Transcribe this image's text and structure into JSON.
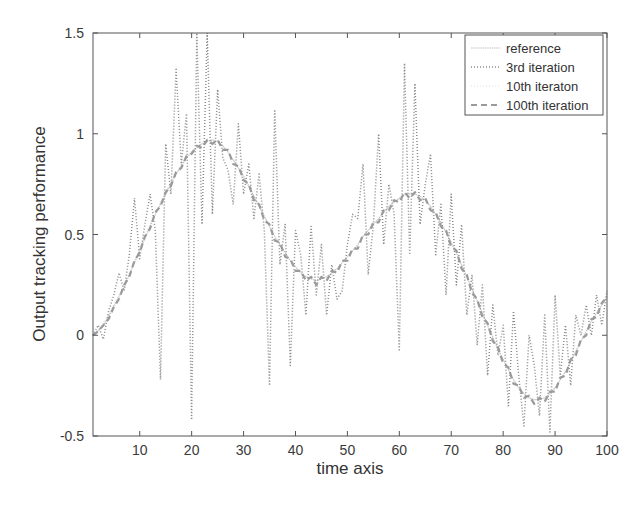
{
  "chart_data": {
    "type": "line",
    "title": "",
    "xlabel": "time axis",
    "ylabel": "Output tracking performance",
    "xlim": [
      1,
      100
    ],
    "ylim": [
      -0.5,
      1.5
    ],
    "xticks": [
      10,
      20,
      30,
      40,
      50,
      60,
      70,
      80,
      90,
      100
    ],
    "yticks": [
      -0.5,
      0,
      0.5,
      1,
      1.5
    ],
    "ytick_labels": [
      "-0.5",
      "0",
      "0.5",
      "1",
      "1.5"
    ],
    "grid": false,
    "legend_position": "upper right",
    "x": [
      1,
      2,
      3,
      4,
      5,
      6,
      7,
      8,
      9,
      10,
      11,
      12,
      13,
      14,
      15,
      16,
      17,
      18,
      19,
      20,
      21,
      22,
      23,
      24,
      25,
      26,
      27,
      28,
      29,
      30,
      31,
      32,
      33,
      34,
      35,
      36,
      37,
      38,
      39,
      40,
      41,
      42,
      43,
      44,
      45,
      46,
      47,
      48,
      49,
      50,
      51,
      52,
      53,
      54,
      55,
      56,
      57,
      58,
      59,
      60,
      61,
      62,
      63,
      64,
      65,
      66,
      67,
      68,
      69,
      70,
      71,
      72,
      73,
      74,
      75,
      76,
      77,
      78,
      79,
      80,
      81,
      82,
      83,
      84,
      85,
      86,
      87,
      88,
      89,
      90,
      91,
      92,
      93,
      94,
      95,
      96,
      97,
      98,
      99,
      100
    ],
    "series": [
      {
        "name": "reference",
        "style": "solid-light",
        "values": [
          0.0,
          0.02,
          0.05,
          0.09,
          0.14,
          0.19,
          0.24,
          0.3,
          0.36,
          0.42,
          0.48,
          0.54,
          0.6,
          0.65,
          0.7,
          0.75,
          0.8,
          0.84,
          0.88,
          0.91,
          0.93,
          0.95,
          0.96,
          0.97,
          0.96,
          0.94,
          0.91,
          0.87,
          0.83,
          0.79,
          0.74,
          0.69,
          0.64,
          0.59,
          0.54,
          0.49,
          0.45,
          0.41,
          0.37,
          0.34,
          0.31,
          0.29,
          0.28,
          0.27,
          0.28,
          0.29,
          0.31,
          0.33,
          0.36,
          0.39,
          0.42,
          0.45,
          0.49,
          0.52,
          0.55,
          0.58,
          0.61,
          0.64,
          0.66,
          0.68,
          0.7,
          0.7,
          0.7,
          0.69,
          0.67,
          0.64,
          0.6,
          0.56,
          0.51,
          0.46,
          0.41,
          0.35,
          0.29,
          0.23,
          0.17,
          0.11,
          0.05,
          -0.01,
          -0.07,
          -0.12,
          -0.17,
          -0.22,
          -0.26,
          -0.29,
          -0.31,
          -0.32,
          -0.32,
          -0.31,
          -0.29,
          -0.26,
          -0.22,
          -0.18,
          -0.13,
          -0.08,
          -0.03,
          0.02,
          0.07,
          0.11,
          0.15,
          0.19
        ]
      },
      {
        "name": "3rd iteration",
        "style": "dotted",
        "values": [
          0.0,
          0.05,
          -0.02,
          0.12,
          0.2,
          0.31,
          0.22,
          0.4,
          0.68,
          0.38,
          0.55,
          0.7,
          0.52,
          -0.22,
          0.95,
          0.7,
          1.32,
          0.85,
          1.1,
          -0.42,
          1.5,
          0.55,
          1.5,
          0.6,
          1.22,
          0.88,
          0.82,
          0.65,
          1.05,
          0.7,
          0.85,
          0.58,
          0.8,
          0.52,
          -0.25,
          1.12,
          0.35,
          0.55,
          -0.15,
          0.52,
          0.4,
          0.1,
          0.54,
          0.2,
          0.45,
          0.1,
          0.35,
          0.18,
          0.22,
          0.45,
          0.6,
          0.58,
          0.85,
          0.3,
          0.55,
          1.0,
          0.45,
          0.75,
          0.6,
          -0.08,
          1.35,
          0.4,
          1.25,
          0.55,
          0.75,
          0.9,
          0.4,
          0.65,
          0.2,
          0.7,
          0.25,
          0.55,
          0.1,
          0.3,
          -0.05,
          0.25,
          -0.2,
          0.15,
          -0.1,
          0.05,
          -0.35,
          0.12,
          -0.2,
          -0.45,
          0.0,
          -0.15,
          -0.4,
          0.1,
          -0.48,
          0.2,
          -0.2,
          0.05,
          -0.25,
          0.1,
          0.0,
          0.15,
          0.0,
          0.2,
          0.05,
          0.22
        ]
      },
      {
        "name": "10th iteraton",
        "style": "dotted-light",
        "values": [
          0.0,
          0.03,
          0.06,
          0.1,
          0.15,
          0.2,
          0.25,
          0.31,
          0.37,
          0.43,
          0.49,
          0.55,
          0.6,
          0.66,
          0.71,
          0.76,
          0.8,
          0.85,
          0.88,
          0.91,
          0.94,
          0.95,
          0.96,
          0.97,
          0.96,
          0.94,
          0.91,
          0.87,
          0.83,
          0.79,
          0.74,
          0.69,
          0.64,
          0.59,
          0.54,
          0.49,
          0.45,
          0.41,
          0.37,
          0.34,
          0.31,
          0.29,
          0.28,
          0.27,
          0.28,
          0.29,
          0.31,
          0.33,
          0.36,
          0.39,
          0.42,
          0.45,
          0.49,
          0.52,
          0.55,
          0.58,
          0.61,
          0.64,
          0.66,
          0.68,
          0.7,
          0.7,
          0.7,
          0.69,
          0.67,
          0.64,
          0.6,
          0.56,
          0.51,
          0.46,
          0.41,
          0.35,
          0.29,
          0.23,
          0.17,
          0.11,
          0.05,
          -0.01,
          -0.07,
          -0.12,
          -0.17,
          -0.22,
          -0.26,
          -0.29,
          -0.31,
          -0.32,
          -0.32,
          -0.31,
          -0.29,
          -0.26,
          -0.22,
          -0.18,
          -0.13,
          -0.08,
          -0.03,
          0.02,
          0.07,
          0.11,
          0.15,
          0.19
        ]
      },
      {
        "name": "100th iteration",
        "style": "dashed",
        "values": [
          0.0,
          0.02,
          0.05,
          0.08,
          0.14,
          0.18,
          0.25,
          0.29,
          0.37,
          0.41,
          0.49,
          0.53,
          0.61,
          0.64,
          0.71,
          0.74,
          0.81,
          0.83,
          0.89,
          0.9,
          0.94,
          0.93,
          0.97,
          0.95,
          0.97,
          0.92,
          0.92,
          0.85,
          0.84,
          0.77,
          0.75,
          0.67,
          0.65,
          0.57,
          0.55,
          0.47,
          0.46,
          0.39,
          0.38,
          0.32,
          0.32,
          0.27,
          0.29,
          0.25,
          0.29,
          0.27,
          0.32,
          0.31,
          0.37,
          0.37,
          0.43,
          0.43,
          0.5,
          0.5,
          0.56,
          0.56,
          0.62,
          0.62,
          0.67,
          0.66,
          0.71,
          0.68,
          0.71,
          0.67,
          0.68,
          0.62,
          0.61,
          0.54,
          0.52,
          0.44,
          0.42,
          0.33,
          0.3,
          0.21,
          0.18,
          0.09,
          0.06,
          -0.03,
          -0.06,
          -0.14,
          -0.16,
          -0.24,
          -0.25,
          -0.31,
          -0.3,
          -0.34,
          -0.31,
          -0.33,
          -0.28,
          -0.28,
          -0.21,
          -0.2,
          -0.12,
          -0.1,
          -0.02,
          0.0,
          0.08,
          0.09,
          0.16,
          0.19
        ]
      }
    ],
    "legend": [
      "reference",
      "3rd iteration",
      "10th iteraton",
      "100th iteration"
    ]
  },
  "colors": {
    "axis": "#555555",
    "reference": "#c4c4c4",
    "iter3": "#8a8a8a",
    "iter10": "#d0d0d0",
    "iter100": "#9a9a9a"
  }
}
